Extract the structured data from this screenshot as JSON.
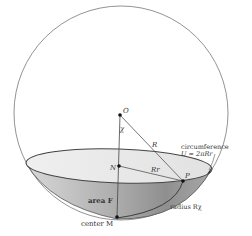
{
  "diagram": {
    "points": {
      "O": {
        "label": "O"
      },
      "N": {
        "label": "N"
      },
      "P": {
        "label": "P"
      },
      "M": {
        "label": "center M"
      }
    },
    "labels": {
      "angle": "χ",
      "radius_R": "R",
      "radius_Rr": "Rr",
      "circumference_title": "circumference",
      "circumference_formula": "U = 2πRr",
      "area": "area F",
      "arc_radius": "radius Rχ"
    },
    "colors": {
      "outline": "#555555",
      "cap_light": "#e6e6e6",
      "cap_dark": "#9a9a9a",
      "cap_mid": "#bdbdbd"
    }
  }
}
